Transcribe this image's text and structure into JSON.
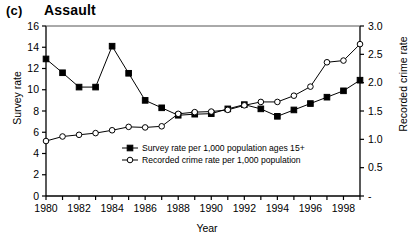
{
  "panel": {
    "letter": "(c)",
    "title": "Assault"
  },
  "axes": {
    "xlabel": "Year",
    "ylabel_left": "Survey rate",
    "ylabel_right": "Recorded crime rate",
    "left_ticks": [
      "0",
      "2",
      "4",
      "6",
      "8",
      "10",
      "12",
      "14",
      "16"
    ],
    "right_ticks": [
      "-",
      "0.5",
      "1.0",
      "1.5",
      "2.0",
      "2.5",
      "3.0"
    ],
    "x_ticks": [
      "1980",
      "1982",
      "1984",
      "1986",
      "1988",
      "1990",
      "1992",
      "1994",
      "1996",
      "1998"
    ]
  },
  "legend": {
    "items": [
      {
        "label": "Survey rate per 1,000 population ages 15+",
        "marker": "filled-square"
      },
      {
        "label": "Recorded crime rate per 1,000 population",
        "marker": "open-circle"
      }
    ]
  },
  "chart_data": {
    "type": "line",
    "title": "Assault",
    "xlabel": "Year",
    "ylabel": "Survey rate",
    "ylabel_secondary": "Recorded crime rate",
    "xlim": [
      1980,
      1999
    ],
    "ylim": [
      0,
      16
    ],
    "ylim_secondary": [
      0,
      3.0
    ],
    "grid": false,
    "legend_position": "inside-bottom-center",
    "x": [
      1980,
      1981,
      1982,
      1983,
      1984,
      1985,
      1986,
      1987,
      1988,
      1989,
      1990,
      1991,
      1992,
      1993,
      1994,
      1995,
      1996,
      1997,
      1998,
      1999
    ],
    "series": [
      {
        "name": "Survey rate per 1,000 population ages 15+",
        "axis": "left",
        "marker": "filled-square",
        "values": [
          12.9,
          11.6,
          10.25,
          10.25,
          14.1,
          11.55,
          9.0,
          8.3,
          7.6,
          7.7,
          7.75,
          8.2,
          8.6,
          8.2,
          7.5,
          8.1,
          8.7,
          9.3,
          9.9,
          10.9
        ]
      },
      {
        "name": "Recorded crime rate per 1,000 population",
        "axis": "right",
        "marker": "open-circle",
        "values": [
          0.97,
          1.05,
          1.08,
          1.11,
          1.16,
          1.22,
          1.21,
          1.23,
          1.45,
          1.48,
          1.49,
          1.52,
          1.6,
          1.66,
          1.66,
          1.77,
          1.93,
          2.36,
          2.39,
          2.68
        ]
      }
    ]
  },
  "colors": {
    "ink": "#000000",
    "background": "#ffffff"
  }
}
